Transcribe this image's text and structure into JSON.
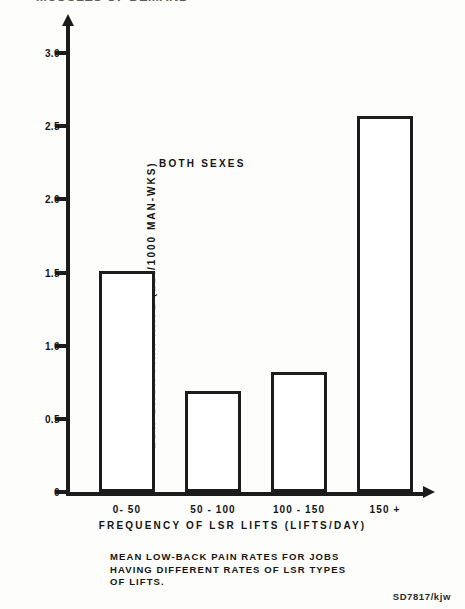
{
  "page": {
    "running_header": "MUSCLES OF DEMAND",
    "figure_code": "SD7817/kjw"
  },
  "caption": {
    "lines": [
      "MEAN LOW-BACK PAIN RATES FOR JOBS",
      "HAVING DIFFERENT RATES OF LSR TYPES",
      "OF LIFTS."
    ]
  },
  "chart_data": {
    "type": "bar",
    "title": "",
    "categories": [
      "0- 50",
      "50 - 100",
      "100 - 150",
      "150 +"
    ],
    "values": [
      1.51,
      0.69,
      0.82,
      2.57
    ],
    "series": [
      {
        "name": "BOTH SEXES",
        "values": [
          1.51,
          0.69,
          0.82,
          2.57
        ]
      }
    ],
    "xlabel": "FREQUENCY  OF  LSR  LIFTS  (LIFTS/DAY)",
    "ylabel": "LOW-BACK  PAIN  RATE  (LBI/1000  MAN-WKS)",
    "ylim": [
      0,
      3.0
    ],
    "yticks": [
      "0",
      "0.5",
      "1.0",
      "1.5",
      "2.0",
      "2.5",
      "3.0"
    ],
    "ytick_values": [
      0,
      0.5,
      1.0,
      1.5,
      2.0,
      2.5,
      3.0
    ],
    "grid": false,
    "legend": "none",
    "annotations": [
      {
        "text": "BOTH  SEXES",
        "x_frac": 0.26,
        "y_value": 2.28
      }
    ],
    "bar_style": {
      "fill": "#ffffff",
      "edge": "#1c1c1c",
      "edge_width": 3
    }
  }
}
